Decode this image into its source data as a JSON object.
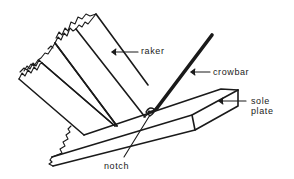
{
  "figure": {
    "type": "technical illustration",
    "colors": {
      "ink": "#1a1a1a",
      "background": "#ffffff"
    }
  },
  "labels": {
    "raker": "raker",
    "crowbar": "crowbar",
    "sole_plate_line1": "sole",
    "sole_plate_line2": "plate",
    "notch": "notch"
  }
}
